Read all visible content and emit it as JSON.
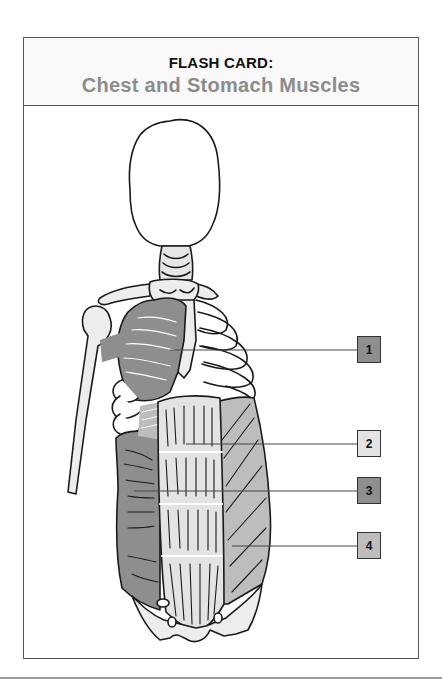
{
  "card": {
    "kicker": "FLASH CARD:",
    "title": "Chest and Stomach Muscles"
  },
  "labels": [
    {
      "number": "1",
      "color": "#8e8e8e",
      "target": "pectoralis-region"
    },
    {
      "number": "2",
      "color": "#e3e3e3",
      "target": "rectus-abdominis"
    },
    {
      "number": "3",
      "color": "#8e8e8e",
      "target": "side-wall-muscle"
    },
    {
      "number": "4",
      "color": "#bdbdbd",
      "target": "external-oblique"
    }
  ],
  "colors": {
    "border": "#555555",
    "title_gray": "#8c8c8c",
    "muscle_dark": "#8e8e8e",
    "muscle_mid": "#bdbdbd",
    "muscle_light": "#e3e3e3",
    "bone": "#ededed",
    "outline": "#1a1a1a"
  }
}
